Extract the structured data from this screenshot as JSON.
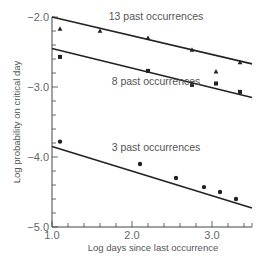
{
  "chart_data": {
    "type": "scatter",
    "title": "",
    "xlabel": "Log days since last occurrence",
    "ylabel": "Log probability on critical day",
    "xlim": [
      1.0,
      3.5
    ],
    "ylim": [
      -5.0,
      -2.0
    ],
    "x_ticks": [
      1.0,
      2.0,
      3.0
    ],
    "x_tick_labels": [
      "1.0",
      "2.0",
      "3.0"
    ],
    "y_ticks": [
      -2.0,
      -3.0,
      -4.0,
      -5.0
    ],
    "y_tick_labels": [
      "-2.0",
      "-3.0",
      "-4.0",
      "-5.0"
    ],
    "minor_tick_step": 0.2,
    "grid": false,
    "legend": "inline labels above each fitted line",
    "series": [
      {
        "name": "13 past occurrences",
        "marker": "triangle",
        "points": [
          {
            "x": 1.1,
            "y": -2.17
          },
          {
            "x": 1.6,
            "y": -2.2
          },
          {
            "x": 2.2,
            "y": -2.3
          },
          {
            "x": 2.75,
            "y": -2.47
          },
          {
            "x": 3.05,
            "y": -2.78
          },
          {
            "x": 3.35,
            "y": -2.65
          }
        ],
        "fit_line": [
          {
            "x": 1.0,
            "y": -2.0
          },
          {
            "x": 3.5,
            "y": -2.67
          }
        ],
        "label_pos": {
          "x": 2.3,
          "y": -2.04
        }
      },
      {
        "name": "8 past occurrences",
        "marker": "square",
        "points": [
          {
            "x": 1.1,
            "y": -2.57
          },
          {
            "x": 2.2,
            "y": -2.77
          },
          {
            "x": 2.75,
            "y": -2.97
          },
          {
            "x": 3.05,
            "y": -2.95
          },
          {
            "x": 3.35,
            "y": -3.07
          }
        ],
        "fit_line": [
          {
            "x": 1.0,
            "y": -2.45
          },
          {
            "x": 3.5,
            "y": -3.15
          }
        ],
        "label_pos": {
          "x": 2.3,
          "y": -2.97
        }
      },
      {
        "name": "3 past occurrences",
        "marker": "circle",
        "points": [
          {
            "x": 1.1,
            "y": -3.78
          },
          {
            "x": 2.1,
            "y": -4.1
          },
          {
            "x": 2.55,
            "y": -4.3
          },
          {
            "x": 2.9,
            "y": -4.43
          },
          {
            "x": 3.1,
            "y": -4.5
          },
          {
            "x": 3.3,
            "y": -4.6
          }
        ],
        "fit_line": [
          {
            "x": 1.0,
            "y": -3.85
          },
          {
            "x": 3.5,
            "y": -4.73
          }
        ],
        "label_pos": {
          "x": 2.3,
          "y": -3.92
        }
      }
    ]
  },
  "colors": {
    "line": "#222222",
    "axis": "#444444",
    "text": "#555555",
    "background": "#ffffff"
  }
}
